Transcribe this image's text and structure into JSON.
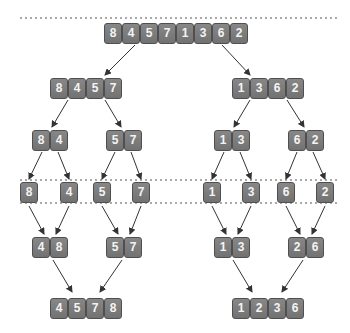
{
  "diagram": {
    "colors": {
      "cell_fill": "#7d7d7d",
      "cell_border": "#4f4f4f",
      "cell_text": "#f4f4f4",
      "arrow": "#333333",
      "dotted_line": "#555555"
    },
    "levels": [
      {
        "name": "input",
        "groups": [
          {
            "values": [
              "8",
              "4",
              "5",
              "7",
              "1",
              "3",
              "6",
              "2"
            ],
            "x": 104,
            "y": 23
          }
        ]
      },
      {
        "name": "split-1",
        "groups": [
          {
            "values": [
              "8",
              "4",
              "5",
              "7"
            ],
            "x": 50,
            "y": 78
          },
          {
            "values": [
              "1",
              "3",
              "6",
              "2"
            ],
            "x": 232,
            "y": 78
          }
        ]
      },
      {
        "name": "split-2",
        "groups": [
          {
            "values": [
              "8",
              "4"
            ],
            "x": 32,
            "y": 130
          },
          {
            "values": [
              "5",
              "7"
            ],
            "x": 106,
            "y": 130
          },
          {
            "values": [
              "1",
              "3"
            ],
            "x": 214,
            "y": 130
          },
          {
            "values": [
              "6",
              "2"
            ],
            "x": 288,
            "y": 130
          }
        ]
      },
      {
        "name": "singletons",
        "groups": [
          {
            "values": [
              "8"
            ],
            "x": 20,
            "y": 182
          },
          {
            "values": [
              "4"
            ],
            "x": 60,
            "y": 182
          },
          {
            "values": [
              "5"
            ],
            "x": 93,
            "y": 182
          },
          {
            "values": [
              "7"
            ],
            "x": 132,
            "y": 182
          },
          {
            "values": [
              "1"
            ],
            "x": 203,
            "y": 182
          },
          {
            "values": [
              "3"
            ],
            "x": 242,
            "y": 182
          },
          {
            "values": [
              "6"
            ],
            "x": 277,
            "y": 182
          },
          {
            "values": [
              "2"
            ],
            "x": 316,
            "y": 182
          }
        ]
      },
      {
        "name": "merge-1",
        "groups": [
          {
            "values": [
              "4",
              "8"
            ],
            "x": 32,
            "y": 237
          },
          {
            "values": [
              "5",
              "7"
            ],
            "x": 106,
            "y": 237
          },
          {
            "values": [
              "1",
              "3"
            ],
            "x": 214,
            "y": 237
          },
          {
            "values": [
              "2",
              "6"
            ],
            "x": 288,
            "y": 237
          }
        ]
      },
      {
        "name": "merge-2",
        "groups": [
          {
            "values": [
              "4",
              "5",
              "7",
              "8"
            ],
            "x": 50,
            "y": 298
          },
          {
            "values": [
              "1",
              "2",
              "3",
              "6"
            ],
            "x": 232,
            "y": 298
          }
        ]
      }
    ],
    "dotted_lines": [
      {
        "y": 18,
        "x1": 20,
        "x2": 337
      },
      {
        "y": 180,
        "x1": 20,
        "x2": 337
      },
      {
        "y": 203,
        "x1": 20,
        "x2": 337
      }
    ],
    "arrows": [
      {
        "x1": 135,
        "y1": 45,
        "x2": 105,
        "y2": 75
      },
      {
        "x1": 222,
        "y1": 45,
        "x2": 250,
        "y2": 75
      },
      {
        "x1": 68,
        "y1": 100,
        "x2": 52,
        "y2": 127
      },
      {
        "x1": 105,
        "y1": 100,
        "x2": 121,
        "y2": 127
      },
      {
        "x1": 250,
        "y1": 100,
        "x2": 234,
        "y2": 127
      },
      {
        "x1": 287,
        "y1": 100,
        "x2": 304,
        "y2": 127
      },
      {
        "x1": 42,
        "y1": 152,
        "x2": 29,
        "y2": 179
      },
      {
        "x1": 58,
        "y1": 152,
        "x2": 69,
        "y2": 179
      },
      {
        "x1": 115,
        "y1": 152,
        "x2": 102,
        "y2": 179
      },
      {
        "x1": 131,
        "y1": 152,
        "x2": 141,
        "y2": 179
      },
      {
        "x1": 224,
        "y1": 152,
        "x2": 212,
        "y2": 179
      },
      {
        "x1": 240,
        "y1": 152,
        "x2": 251,
        "y2": 179
      },
      {
        "x1": 297,
        "y1": 152,
        "x2": 286,
        "y2": 179
      },
      {
        "x1": 313,
        "y1": 152,
        "x2": 325,
        "y2": 179
      },
      {
        "x1": 29,
        "y1": 206,
        "x2": 44,
        "y2": 234
      },
      {
        "x1": 69,
        "y1": 206,
        "x2": 56,
        "y2": 234
      },
      {
        "x1": 102,
        "y1": 206,
        "x2": 118,
        "y2": 234
      },
      {
        "x1": 141,
        "y1": 206,
        "x2": 130,
        "y2": 234
      },
      {
        "x1": 212,
        "y1": 206,
        "x2": 226,
        "y2": 234
      },
      {
        "x1": 251,
        "y1": 206,
        "x2": 238,
        "y2": 234
      },
      {
        "x1": 286,
        "y1": 206,
        "x2": 300,
        "y2": 234
      },
      {
        "x1": 325,
        "y1": 206,
        "x2": 312,
        "y2": 234
      },
      {
        "x1": 53,
        "y1": 260,
        "x2": 72,
        "y2": 292
      },
      {
        "x1": 122,
        "y1": 260,
        "x2": 100,
        "y2": 292
      },
      {
        "x1": 233,
        "y1": 260,
        "x2": 252,
        "y2": 292
      },
      {
        "x1": 303,
        "y1": 260,
        "x2": 282,
        "y2": 292
      }
    ]
  }
}
